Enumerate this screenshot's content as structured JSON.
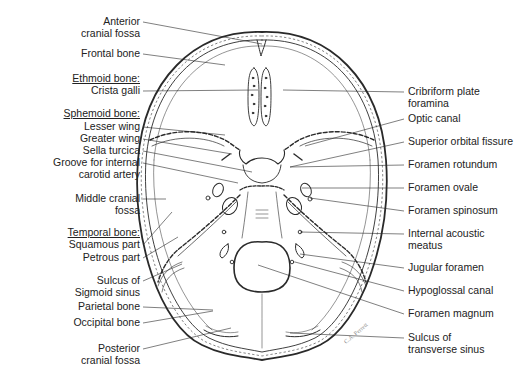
{
  "figure": {
    "labels_left": [
      {
        "id": "anterior-cranial-fossa",
        "lines": [
          "Anterior",
          "cranial fossa"
        ],
        "x": 146,
        "y": 15,
        "tx": 262,
        "ty": 44
      },
      {
        "id": "frontal-bone",
        "lines": [
          "Frontal bone"
        ],
        "x": 146,
        "y": 47,
        "tx": 225,
        "ty": 65
      },
      {
        "id": "ethmoid-bone-header",
        "lines": [
          "Ethmoid bone:"
        ],
        "x": 146,
        "y": 72,
        "header": true
      },
      {
        "id": "crista-galli",
        "lines": [
          "Crista galli"
        ],
        "x": 146,
        "y": 84,
        "tx": 258,
        "ty": 90
      },
      {
        "id": "sphenoid-bone-header",
        "lines": [
          "Sphemoid bone:"
        ],
        "x": 146,
        "y": 107,
        "header": true
      },
      {
        "id": "lesser-wing",
        "lines": [
          "Lesser wing"
        ],
        "x": 146,
        "y": 120,
        "tx": 225,
        "ty": 135
      },
      {
        "id": "greater-wing",
        "lines": [
          "Greater wing"
        ],
        "x": 146,
        "y": 132,
        "tx": 232,
        "ty": 154
      },
      {
        "id": "sella-turcica",
        "lines": [
          "Sella turcica"
        ],
        "x": 146,
        "y": 144,
        "tx": 252,
        "ty": 172
      },
      {
        "id": "groove-internal-carotid",
        "lines": [
          "Groove for internal",
          "carotid artery"
        ],
        "x": 146,
        "y": 156,
        "tx": 238,
        "ty": 183
      },
      {
        "id": "middle-cranial-fossa",
        "lines": [
          "Middle cranial",
          "fossa"
        ],
        "x": 146,
        "y": 192,
        "tx": 166,
        "ty": 199
      },
      {
        "id": "temporal-bone-header",
        "lines": [
          "Temporal bone:"
        ],
        "x": 146,
        "y": 226,
        "header": true
      },
      {
        "id": "squamous-part",
        "lines": [
          "Squamous part"
        ],
        "x": 146,
        "y": 238,
        "tx": 172,
        "ty": 212
      },
      {
        "id": "petrous-part",
        "lines": [
          "Petrous part"
        ],
        "x": 146,
        "y": 251,
        "tx": 178,
        "ty": 237
      },
      {
        "id": "sulcus-sigmoid-sinus",
        "lines": [
          "Sulcus of",
          "Sigmoid sinus"
        ],
        "x": 146,
        "y": 274,
        "tx": 182,
        "ty": 264
      },
      {
        "id": "parietal-bone",
        "lines": [
          "Parietal bone"
        ],
        "x": 146,
        "y": 300,
        "tx": 213,
        "ty": 310
      },
      {
        "id": "occipital-bone",
        "lines": [
          "Occipital bone"
        ],
        "x": 146,
        "y": 316,
        "tx": 213,
        "ty": 311
      },
      {
        "id": "posterior-cranial-fossa",
        "lines": [
          "Posterior",
          "cranial fossa"
        ],
        "x": 146,
        "y": 342,
        "tx": 231,
        "ty": 328
      }
    ],
    "labels_right": [
      {
        "id": "cribriform-plate-foramina",
        "lines": [
          "Cribriform plate",
          "foramina"
        ],
        "x": 408,
        "y": 85,
        "tx": 283,
        "ty": 90
      },
      {
        "id": "optic-canal",
        "lines": [
          "Optic canal"
        ],
        "x": 408,
        "y": 112,
        "tx": 305,
        "ty": 146
      },
      {
        "id": "superior-orbital-fissure",
        "lines": [
          "Superior orbital fissure"
        ],
        "x": 408,
        "y": 135,
        "tx": 290,
        "ty": 167
      },
      {
        "id": "foramen-rotundum",
        "lines": [
          "Foramen rotundum"
        ],
        "x": 408,
        "y": 158,
        "tx": 290,
        "ty": 167
      },
      {
        "id": "foramen-ovale",
        "lines": [
          "Foramen ovale"
        ],
        "x": 408,
        "y": 181,
        "tx": 302,
        "ty": 188
      },
      {
        "id": "foramen-spinosum",
        "lines": [
          "Foramen spinosum"
        ],
        "x": 408,
        "y": 204,
        "tx": 310,
        "ty": 198
      },
      {
        "id": "internal-acoustic-meatus",
        "lines": [
          "Internal acoustic",
          "meatus"
        ],
        "x": 408,
        "y": 227,
        "tx": 300,
        "ty": 232
      },
      {
        "id": "jugular-foramen",
        "lines": [
          "Jugular foramen"
        ],
        "x": 408,
        "y": 261,
        "tx": 300,
        "ty": 254
      },
      {
        "id": "hypoglossal-canal",
        "lines": [
          "Hypoglossal canal"
        ],
        "x": 408,
        "y": 284,
        "tx": 295,
        "ty": 262
      },
      {
        "id": "foramen-magnum",
        "lines": [
          "Foramen magnum"
        ],
        "x": 408,
        "y": 307,
        "tx": 258,
        "ty": 265
      },
      {
        "id": "sulcus-transverse-sinus",
        "lines": [
          "Sulcus of",
          "transverse sinus"
        ],
        "x": 408,
        "y": 331,
        "tx": 290,
        "ty": 333
      }
    ],
    "signature": "C.A. Perrett",
    "line_color": "#2a2a2a"
  }
}
